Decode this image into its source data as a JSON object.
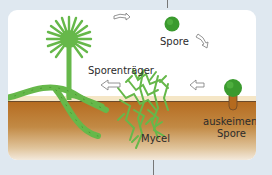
{
  "diagram": {
    "type": "life-cycle",
    "labels": {
      "spore": "Spore",
      "sporangiophore": "Sporenträger",
      "germinating_spore": "auskeimende Spore",
      "germinating_spore_line1": "auskeimende",
      "germinating_spore_line2": "Spore",
      "mycelium": "Mycel"
    },
    "arrows": [
      {
        "from": "Sporenträger",
        "to": "Spore",
        "icon": "curved-arrow-right-icon"
      },
      {
        "from": "Spore",
        "to": "auskeimende Spore",
        "icon": "curved-arrow-down-right-icon"
      },
      {
        "from": "auskeimende Spore",
        "to": "Mycel",
        "icon": "arrow-left-icon"
      },
      {
        "from": "Mycel",
        "to": "Sporenträger",
        "icon": "arrow-left-icon"
      }
    ],
    "colors": {
      "fungus_green": "#66b84a",
      "spore_green": "#3a9a2e",
      "soil_brown": "#b56a1e",
      "background": "#dfe8f0"
    }
  }
}
